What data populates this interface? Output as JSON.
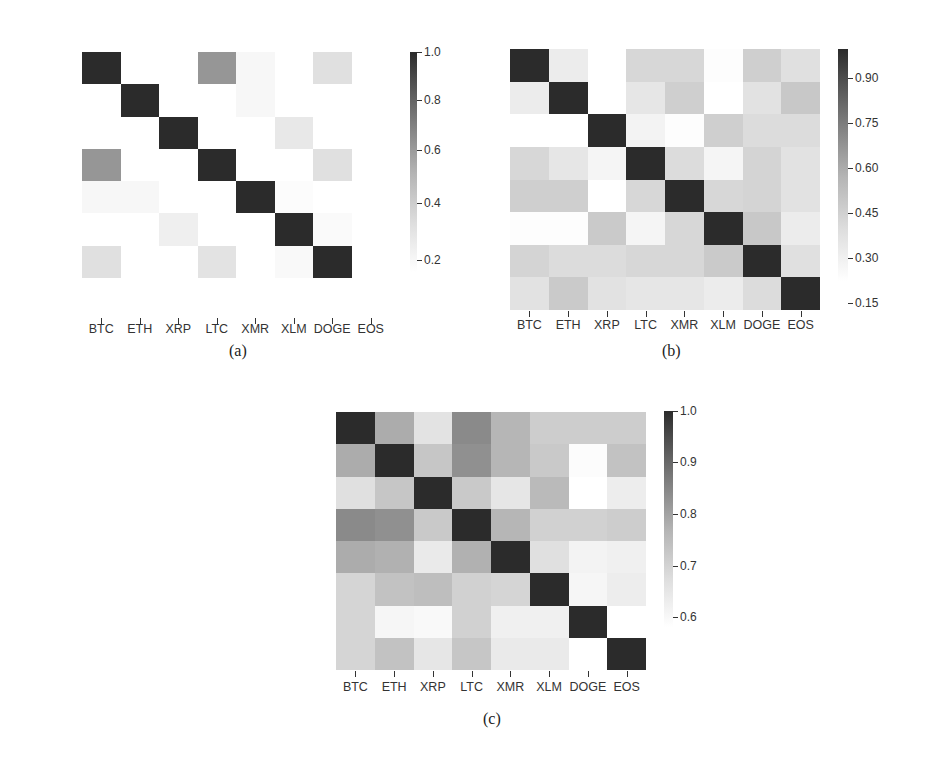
{
  "labels": [
    "BTC",
    "ETH",
    "XRP",
    "LTC",
    "XMR",
    "XLM",
    "DOGE",
    "EOS"
  ],
  "chart_data": [
    {
      "id": "a",
      "type": "heatmap",
      "caption": "(a)",
      "title": "",
      "xlabel": "",
      "ylabel": "",
      "x_labels": [
        "BTC",
        "ETH",
        "XRP",
        "LTC",
        "XMR",
        "XLM",
        "DOGE",
        "EOS"
      ],
      "y_labels": [
        "BTC",
        "ETH",
        "XRP",
        "LTC",
        "XMR",
        "XLM",
        "DOGE",
        "EOS"
      ],
      "colorbar": {
        "vmin": 0.15,
        "vmax": 1.0,
        "ticks": [
          "1.0",
          "0.8",
          "0.6",
          "0.4",
          "0.2"
        ],
        "tick_values": [
          1.0,
          0.8,
          0.6,
          0.4,
          0.2
        ]
      },
      "colormap": "greys",
      "values": [
        [
          1.0,
          0.15,
          0.15,
          0.68,
          0.2,
          0.15,
          0.35,
          0.15
        ],
        [
          0.15,
          1.0,
          0.15,
          0.15,
          0.2,
          0.15,
          0.15,
          0.15
        ],
        [
          0.15,
          0.15,
          1.0,
          0.15,
          0.15,
          0.3,
          0.15,
          0.15
        ],
        [
          0.68,
          0.15,
          0.15,
          1.0,
          0.15,
          0.15,
          0.35,
          0.15
        ],
        [
          0.2,
          0.2,
          0.15,
          0.15,
          1.0,
          0.17,
          0.15,
          0.15
        ],
        [
          0.15,
          0.15,
          0.25,
          0.15,
          0.15,
          1.0,
          0.18,
          0.15
        ],
        [
          0.35,
          0.15,
          0.15,
          0.33,
          0.15,
          0.19,
          1.0,
          0.15
        ],
        [
          0.15,
          0.15,
          0.15,
          0.15,
          0.15,
          0.15,
          0.15,
          0.15
        ]
      ]
    },
    {
      "id": "b",
      "type": "heatmap",
      "caption": "(b)",
      "title": "",
      "xlabel": "",
      "ylabel": "",
      "x_labels": [
        "BTC",
        "ETH",
        "XRP",
        "LTC",
        "XMR",
        "XLM",
        "DOGE",
        "EOS"
      ],
      "y_labels": [
        "BTC",
        "ETH",
        "XRP",
        "LTC",
        "XMR",
        "XLM",
        "DOGE",
        "EOS"
      ],
      "colorbar": {
        "vmin": 0.32,
        "vmax": 1.0,
        "ticks": [
          "0.90",
          "0.75",
          "0.60",
          "0.45",
          "0.30",
          "0.15"
        ],
        "tick_values": [
          0.9,
          0.75,
          0.6,
          0.45,
          0.3,
          0.15
        ]
      },
      "colormap": "greys",
      "values": [
        [
          1.0,
          0.42,
          0.3,
          0.52,
          0.52,
          0.33,
          0.55,
          0.48
        ],
        [
          0.42,
          1.0,
          0.3,
          0.45,
          0.55,
          0.32,
          0.47,
          0.58
        ],
        [
          0.3,
          0.3,
          1.0,
          0.38,
          0.33,
          0.55,
          0.5,
          0.5
        ],
        [
          0.52,
          0.45,
          0.37,
          1.0,
          0.5,
          0.37,
          0.53,
          0.47
        ],
        [
          0.55,
          0.55,
          0.32,
          0.52,
          1.0,
          0.52,
          0.53,
          0.47
        ],
        [
          0.33,
          0.33,
          0.57,
          0.37,
          0.52,
          1.0,
          0.58,
          0.42
        ],
        [
          0.53,
          0.5,
          0.5,
          0.52,
          0.52,
          0.57,
          1.0,
          0.48
        ],
        [
          0.47,
          0.57,
          0.47,
          0.45,
          0.45,
          0.42,
          0.5,
          1.0
        ]
      ]
    },
    {
      "id": "c",
      "type": "heatmap",
      "caption": "(c)",
      "title": "",
      "xlabel": "",
      "ylabel": "",
      "x_labels": [
        "BTC",
        "ETH",
        "XRP",
        "LTC",
        "XMR",
        "XLM",
        "DOGE",
        "EOS"
      ],
      "y_labels": [
        "BTC",
        "ETH",
        "XRP",
        "LTC",
        "XMR",
        "XLM",
        "DOGE",
        "EOS"
      ],
      "colorbar": {
        "vmin": 0.57,
        "vmax": 1.0,
        "ticks": [
          "1.0",
          "0.9",
          "0.8",
          "0.7",
          "0.6"
        ],
        "tick_values": [
          1.0,
          0.9,
          0.8,
          0.7,
          0.6
        ]
      },
      "colormap": "greys",
      "values": [
        [
          1.0,
          0.8,
          0.66,
          0.86,
          0.78,
          0.72,
          0.72,
          0.72
        ],
        [
          0.8,
          1.0,
          0.74,
          0.85,
          0.78,
          0.73,
          0.58,
          0.75
        ],
        [
          0.67,
          0.74,
          1.0,
          0.73,
          0.65,
          0.77,
          0.57,
          0.63
        ],
        [
          0.86,
          0.85,
          0.73,
          1.0,
          0.78,
          0.71,
          0.71,
          0.72
        ],
        [
          0.8,
          0.79,
          0.64,
          0.79,
          1.0,
          0.67,
          0.61,
          0.62
        ],
        [
          0.7,
          0.75,
          0.76,
          0.71,
          0.7,
          1.0,
          0.6,
          0.63
        ],
        [
          0.7,
          0.6,
          0.59,
          0.71,
          0.62,
          0.62,
          1.0,
          0.57
        ],
        [
          0.7,
          0.75,
          0.65,
          0.74,
          0.64,
          0.64,
          0.57,
          1.0
        ]
      ]
    }
  ],
  "colors": {
    "dark": "#2b2b2b",
    "light": "#ffffff",
    "text": "#333333"
  }
}
